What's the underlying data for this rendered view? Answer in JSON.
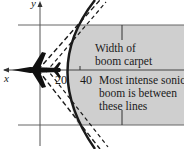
{
  "diagram": {
    "title": "",
    "axes": {
      "x_label": "x",
      "y_label": "y"
    },
    "ticks": [
      {
        "label": "20"
      },
      {
        "label": "40"
      }
    ],
    "annotations": {
      "width_label_line1": "Width of",
      "width_label_line2": "boom carpet",
      "intense_label_line1": "Most intense sonic",
      "intense_label_line2": "boom is between",
      "intense_label_line3": "these lines"
    },
    "colors": {
      "shade": "#cfcfcf",
      "line": "#1a1a1a",
      "axis": "#555555",
      "background": "#ffffff"
    }
  }
}
